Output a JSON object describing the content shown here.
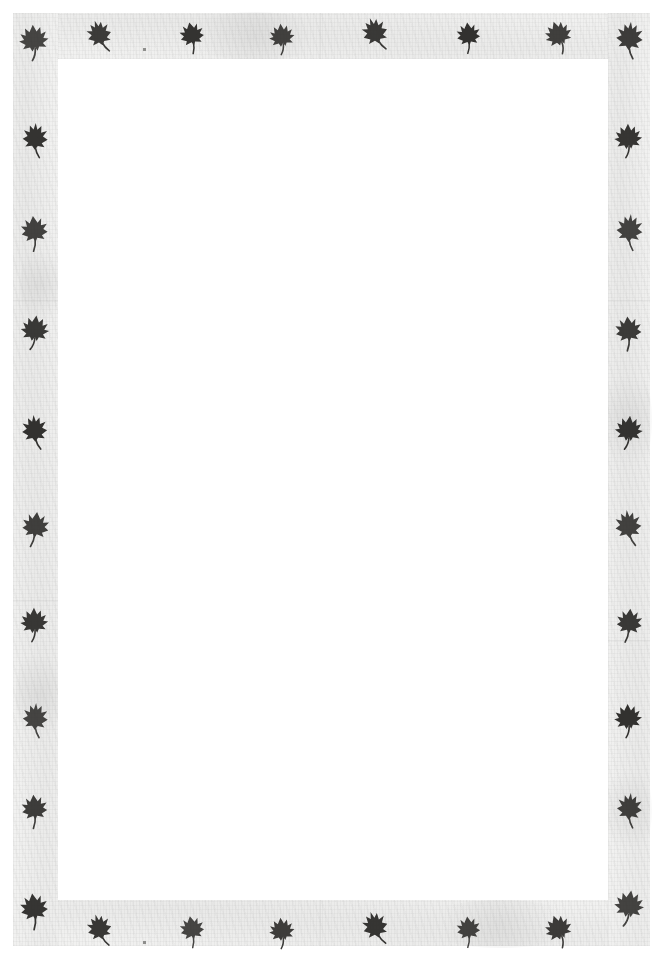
{
  "page": {
    "width": 661,
    "height": 960,
    "background_color": "#ffffff",
    "band_color": "#f1f1f0",
    "ink_color": "#2b2a28",
    "field_color": "#ffffff"
  },
  "frame": {
    "outer_margin_px": 13,
    "band_width_px": 45,
    "field": {
      "x": 58,
      "y": 59,
      "width": 550,
      "height": 841,
      "content": ""
    }
  },
  "motifs": {
    "icon_name": "leaf-icon",
    "total_count": 36,
    "corners": [
      {
        "name": "corner-top-left",
        "x": 18,
        "y": 22,
        "rotate": -6,
        "scale": 1.02
      },
      {
        "name": "corner-top-right",
        "x": 612,
        "y": 20,
        "rotate": 5,
        "scale": 1.02
      },
      {
        "name": "corner-bottom-left",
        "x": 18,
        "y": 890,
        "rotate": -8,
        "scale": 1.03
      },
      {
        "name": "corner-bottom-right",
        "x": 612,
        "y": 888,
        "rotate": 6,
        "scale": 1.03
      }
    ],
    "top_row": [
      {
        "x": 84,
        "y": 16,
        "rotate": -18,
        "scale": 0.92
      },
      {
        "x": 176,
        "y": 16,
        "rotate": -12,
        "scale": 0.9
      },
      {
        "x": 266,
        "y": 18,
        "rotate": -8,
        "scale": 0.88
      },
      {
        "x": 360,
        "y": 14,
        "rotate": -20,
        "scale": 0.95
      },
      {
        "x": 452,
        "y": 16,
        "rotate": -6,
        "scale": 0.88
      },
      {
        "x": 544,
        "y": 16,
        "rotate": -22,
        "scale": 0.94
      }
    ],
    "bottom_row": [
      {
        "x": 84,
        "y": 910,
        "rotate": -16,
        "scale": 0.92
      },
      {
        "x": 176,
        "y": 910,
        "rotate": -10,
        "scale": 0.9
      },
      {
        "x": 266,
        "y": 912,
        "rotate": -8,
        "scale": 0.88
      },
      {
        "x": 360,
        "y": 908,
        "rotate": -18,
        "scale": 0.95
      },
      {
        "x": 452,
        "y": 910,
        "rotate": -6,
        "scale": 0.88
      },
      {
        "x": 544,
        "y": 910,
        "rotate": -22,
        "scale": 0.94
      }
    ],
    "left_column": [
      {
        "x": 18,
        "y": 120,
        "rotate": 2,
        "scale": 0.96
      },
      {
        "x": 18,
        "y": 212,
        "rotate": -6,
        "scale": 1.0
      },
      {
        "x": 18,
        "y": 312,
        "rotate": 4,
        "scale": 0.98
      },
      {
        "x": 18,
        "y": 412,
        "rotate": -4,
        "scale": 0.96
      },
      {
        "x": 18,
        "y": 508,
        "rotate": 6,
        "scale": 1.0
      },
      {
        "x": 18,
        "y": 604,
        "rotate": -3,
        "scale": 0.96
      },
      {
        "x": 18,
        "y": 700,
        "rotate": 3,
        "scale": 0.96
      },
      {
        "x": 18,
        "y": 790,
        "rotate": -5,
        "scale": 0.96
      }
    ],
    "right_column": [
      {
        "x": 612,
        "y": 120,
        "rotate": -3,
        "scale": 0.96
      },
      {
        "x": 612,
        "y": 212,
        "rotate": 5,
        "scale": 1.0
      },
      {
        "x": 612,
        "y": 312,
        "rotate": -5,
        "scale": 0.98
      },
      {
        "x": 612,
        "y": 412,
        "rotate": 3,
        "scale": 0.96
      },
      {
        "x": 612,
        "y": 508,
        "rotate": -6,
        "scale": 1.0
      },
      {
        "x": 612,
        "y": 604,
        "rotate": 4,
        "scale": 0.96
      },
      {
        "x": 612,
        "y": 700,
        "rotate": -4,
        "scale": 0.96
      },
      {
        "x": 612,
        "y": 790,
        "rotate": 5,
        "scale": 0.96
      }
    ]
  },
  "artifacts": {
    "specks": [
      {
        "name": "ink-speck-top",
        "x": 143,
        "y": 48
      },
      {
        "name": "ink-speck-bottom",
        "x": 143,
        "y": 941
      }
    ],
    "seams": [
      {
        "x": 13,
        "y": 300,
        "w": 45,
        "h": 1
      },
      {
        "x": 13,
        "y": 600,
        "w": 45,
        "h": 1
      },
      {
        "x": 608,
        "y": 300,
        "w": 42,
        "h": 1
      },
      {
        "x": 608,
        "y": 640,
        "w": 42,
        "h": 1
      },
      {
        "x": 320,
        "y": 13,
        "w": 1,
        "h": 46
      },
      {
        "x": 320,
        "y": 900,
        "w": 1,
        "h": 46
      }
    ]
  }
}
